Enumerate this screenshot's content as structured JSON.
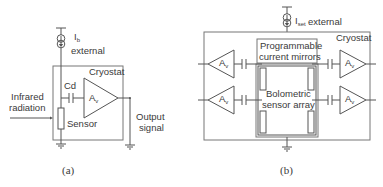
{
  "panel_a": {
    "current_source": {
      "symbol": "I",
      "subscript": "b",
      "label": "external"
    },
    "cryostat_label": "Cryostat",
    "capacitor_label": "Cd",
    "amplifier": {
      "symbol": "A",
      "subscript": "v"
    },
    "input_label_line1": "Infrared",
    "input_label_line2": "radiation",
    "sensor_label": "Sensor",
    "output_label_line1": "Output",
    "output_label_line2": "signal",
    "caption": "(a)"
  },
  "panel_b": {
    "current_source": {
      "symbol": "I",
      "subscript": "set",
      "label": "external"
    },
    "cryostat_label": "Cryostat",
    "mirrors_line1": "Programmable",
    "mirrors_line2": "current mirrors",
    "array_line1": "Bolometric",
    "array_line2": "sensor array",
    "amplifiers": [
      {
        "symbol": "A",
        "subscript": "v"
      },
      {
        "symbol": "A",
        "subscript": "v"
      },
      {
        "symbol": "A",
        "subscript": "v"
      },
      {
        "symbol": "A",
        "subscript": "v"
      }
    ],
    "caption": "(b)"
  }
}
